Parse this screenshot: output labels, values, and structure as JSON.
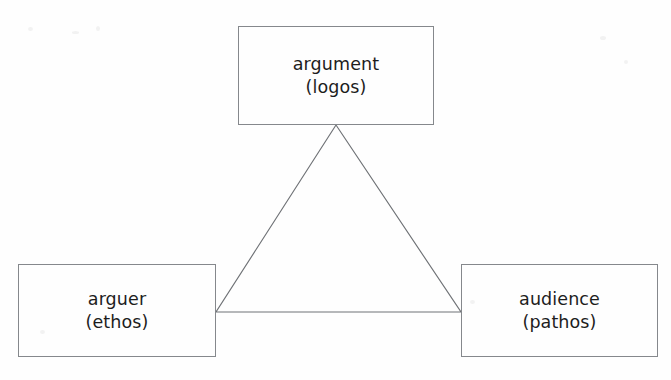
{
  "diagram": {
    "type": "triangle-diagram",
    "background_color": "#fefefe",
    "stroke_color": "#85888c",
    "triangle_stroke_color": "#6f7276",
    "text_color": "#1d1d1d",
    "nodes": [
      {
        "id": "argument",
        "position": "top",
        "label_primary": "argument",
        "label_secondary": "(logos)"
      },
      {
        "id": "arguer",
        "position": "bottom-left",
        "label_primary": "arguer",
        "label_secondary": "(ethos)"
      },
      {
        "id": "audience",
        "position": "bottom-right",
        "label_primary": "audience",
        "label_secondary": "(pathos)"
      }
    ],
    "triangle": {
      "apex": [
        336,
        125
      ],
      "bottom_left": [
        216,
        312
      ],
      "bottom_right": [
        461,
        312
      ]
    }
  }
}
